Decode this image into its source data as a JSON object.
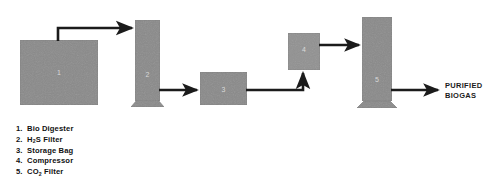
{
  "diagram": {
    "palette": {
      "block_fill": "#8a8a8a",
      "block_fill_light": "#919191",
      "block_stroke": "#7a7a7a",
      "arrow": "#1b1b1b",
      "background": "#ffffff",
      "unit_number": "#d9d9d9",
      "text": "#111111"
    },
    "blocks": [
      {
        "id": "1",
        "number": "1",
        "name": "bio-digester",
        "shape": "square"
      },
      {
        "id": "2",
        "number": "2",
        "name": "h2s-filter",
        "shape": "column"
      },
      {
        "id": "3",
        "number": "3",
        "name": "storage-bag",
        "shape": "rectangle"
      },
      {
        "id": "4",
        "number": "4",
        "name": "compressor",
        "shape": "rectangle"
      },
      {
        "id": "5",
        "number": "5",
        "name": "co2-filter",
        "shape": "column"
      }
    ],
    "connectors": [
      {
        "name": "digester-to-h2s-filter",
        "from": "1",
        "to": "2"
      },
      {
        "name": "h2s-filter-to-storage-bag",
        "from": "2",
        "to": "3"
      },
      {
        "name": "storage-bag-to-compressor",
        "from": "3",
        "to": "4"
      },
      {
        "name": "compressor-to-co2-filter",
        "from": "4",
        "to": "5"
      },
      {
        "name": "co2-filter-to-output",
        "from": "5",
        "to": "output"
      }
    ],
    "output": {
      "line1": "PURIFIED",
      "line2": "BIOGAS"
    },
    "legend": [
      {
        "num": "1.",
        "label": "Bio Digester",
        "sub": ""
      },
      {
        "num": "2.",
        "label_pre": "H",
        "sub": "2",
        "label_post": "S Filter"
      },
      {
        "num": "3.",
        "label": "Storage Bag",
        "sub": ""
      },
      {
        "num": "4.",
        "label": "Compressor",
        "sub": ""
      },
      {
        "num": "5.",
        "label_pre": "CO",
        "sub": "2",
        "label_post": " Filter"
      }
    ]
  }
}
